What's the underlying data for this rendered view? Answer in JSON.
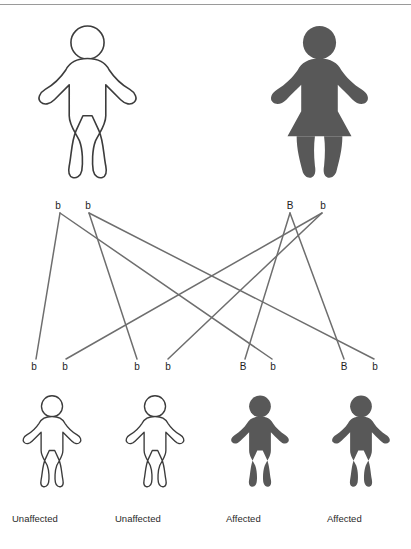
{
  "diagram": {
    "type": "punnett-cross-pedigree",
    "trait": "autosomal dominant inheritance",
    "colors": {
      "affected_fill": "#585858",
      "unaffected_fill": "#ffffff",
      "outline": "#3c3c3c",
      "line": "#6e6e6e",
      "text": "#2a2a2a"
    }
  },
  "parents": [
    {
      "id": "father",
      "sex": "male",
      "status": "unaffected",
      "filled": false,
      "genotype": "bb",
      "alleles": [
        {
          "label": "b",
          "x": 58,
          "y": 207
        },
        {
          "label": "b",
          "x": 88,
          "y": 207
        }
      ],
      "figure": {
        "x": 30,
        "y": 22,
        "width": 115,
        "height": 160
      }
    },
    {
      "id": "mother",
      "sex": "female",
      "status": "affected",
      "filled": true,
      "genotype": "Bb",
      "alleles": [
        {
          "label": "B",
          "x": 290,
          "y": 207
        },
        {
          "label": "b",
          "x": 323,
          "y": 207
        }
      ],
      "figure": {
        "x": 262,
        "y": 22,
        "width": 115,
        "height": 160
      }
    }
  ],
  "offspring": [
    {
      "id": "child-1",
      "status": "Unaffected",
      "filled": false,
      "genotype": "bb",
      "alleles": [
        {
          "label": "b",
          "x": 34,
          "y": 367
        },
        {
          "label": "b",
          "x": 65,
          "y": 367
        }
      ],
      "figure": {
        "x": 18,
        "y": 392,
        "width": 68,
        "height": 98
      },
      "caption": "Unaffected",
      "caption_x": 12,
      "caption_y": 513
    },
    {
      "id": "child-2",
      "status": "Unaffected",
      "filled": false,
      "genotype": "bb",
      "alleles": [
        {
          "label": "b",
          "x": 137,
          "y": 367
        },
        {
          "label": "b",
          "x": 168,
          "y": 367
        }
      ],
      "figure": {
        "x": 121,
        "y": 392,
        "width": 68,
        "height": 98
      },
      "caption": "Unaffected",
      "caption_x": 115,
      "caption_y": 513
    },
    {
      "id": "child-3",
      "status": "Affected",
      "filled": true,
      "genotype": "Bb",
      "alleles": [
        {
          "label": "B",
          "x": 243,
          "y": 367
        },
        {
          "label": "b",
          "x": 273,
          "y": 367
        }
      ],
      "figure": {
        "x": 226,
        "y": 392,
        "width": 68,
        "height": 98
      },
      "caption": "Affected",
      "caption_x": 226,
      "caption_y": 513
    },
    {
      "id": "child-4",
      "status": "Affected",
      "filled": true,
      "genotype": "Bb",
      "alleles": [
        {
          "label": "B",
          "x": 344,
          "y": 367
        },
        {
          "label": "b",
          "x": 375,
          "y": 367
        }
      ],
      "figure": {
        "x": 327,
        "y": 392,
        "width": 68,
        "height": 98
      },
      "caption": "Affected",
      "caption_x": 327,
      "caption_y": 513
    }
  ],
  "connections": [
    {
      "from": "father-allele-1",
      "to": "child-1-allele-1",
      "x1": 60,
      "y1": 213,
      "x2": 36,
      "y2": 359
    },
    {
      "from": "father-allele-1",
      "to": "child-3-allele-2",
      "x1": 60,
      "y1": 213,
      "x2": 272,
      "y2": 359
    },
    {
      "from": "father-allele-2",
      "to": "child-2-allele-1",
      "x1": 89,
      "y1": 213,
      "x2": 137,
      "y2": 359
    },
    {
      "from": "father-allele-2",
      "to": "child-4-allele-2",
      "x1": 89,
      "y1": 213,
      "x2": 374,
      "y2": 359
    },
    {
      "from": "mother-allele-1",
      "to": "child-3-allele-1",
      "x1": 290,
      "y1": 213,
      "x2": 245,
      "y2": 359
    },
    {
      "from": "mother-allele-1",
      "to": "child-4-allele-1",
      "x1": 290,
      "y1": 213,
      "x2": 344,
      "y2": 359
    },
    {
      "from": "mother-allele-2",
      "to": "child-1-allele-2",
      "x1": 322,
      "y1": 213,
      "x2": 66,
      "y2": 359
    },
    {
      "from": "mother-allele-2",
      "to": "child-2-allele-2",
      "x1": 322,
      "y1": 213,
      "x2": 168,
      "y2": 359
    }
  ]
}
